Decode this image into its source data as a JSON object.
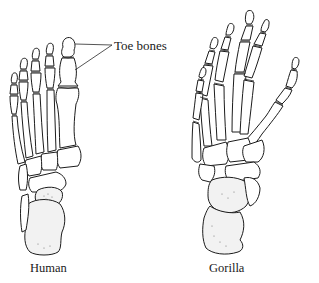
{
  "figure": {
    "annotation": {
      "text": "Toe bones",
      "pointer_count": 2
    },
    "panels": [
      {
        "id": "human",
        "caption": "Human"
      },
      {
        "id": "gorilla",
        "caption": "Gorilla"
      }
    ],
    "colors": {
      "background": "#ffffff",
      "ink": "#1c1c1c"
    }
  }
}
